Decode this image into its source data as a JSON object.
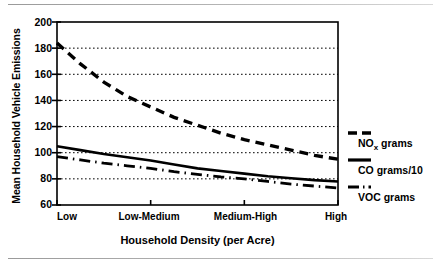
{
  "chart_data": {
    "type": "line",
    "title": "",
    "xlabel": "Household Density (per Acre)",
    "ylabel": "Mean Household Vehicle Emissions",
    "categories": [
      "Low",
      "Low-Medium",
      "Medium-High",
      "High"
    ],
    "x": [
      0,
      1,
      2,
      3
    ],
    "ylim": [
      60,
      200
    ],
    "yticks": [
      60,
      80,
      100,
      120,
      140,
      160,
      180,
      200
    ],
    "grid": "horizontal-dotted",
    "legend_position": "right-outside",
    "series": [
      {
        "name": "NOx grams",
        "style": "dashed",
        "values": [
          184,
          135,
          110,
          95
        ],
        "dense_x": [
          0,
          0.25,
          0.5,
          0.75,
          1,
          1.25,
          1.5,
          1.75,
          2,
          2.25,
          2.5,
          2.75,
          3
        ],
        "dense_y": [
          184,
          168,
          154,
          143,
          135,
          127,
          121,
          115,
          110,
          106,
          102,
          98,
          95
        ]
      },
      {
        "name": "CO grams/10",
        "style": "solid",
        "values": [
          105,
          94,
          84,
          78
        ],
        "dense_x": [
          0,
          0.25,
          0.5,
          0.75,
          1,
          1.25,
          1.5,
          1.75,
          2,
          2.25,
          2.5,
          2.75,
          3
        ],
        "dense_y": [
          105,
          102,
          99,
          96.5,
          94,
          91,
          88,
          86,
          84,
          82,
          80.5,
          79,
          78
        ]
      },
      {
        "name": "VOC grams",
        "style": "dash-dot",
        "values": [
          97,
          88,
          80,
          73
        ],
        "dense_x": [
          0,
          0.25,
          0.5,
          0.75,
          1,
          1.25,
          1.5,
          1.75,
          2,
          2.25,
          2.5,
          2.75,
          3
        ],
        "dense_y": [
          97,
          94.5,
          92,
          90,
          88,
          85.5,
          83.5,
          81.5,
          80,
          78,
          76,
          74.5,
          73
        ]
      }
    ]
  },
  "axes": {
    "y_title": "Mean Household Vehicle Emissions",
    "x_title": "Household Density (per Acre)",
    "y_ticks": [
      "200",
      "180",
      "160",
      "140",
      "120",
      "100",
      "80",
      "60"
    ],
    "x_ticks": [
      "Low",
      "Low-Medium",
      "Medium-High",
      "High"
    ]
  },
  "legend": {
    "items": [
      {
        "label": "NO",
        "sub": "x",
        "rest": " grams",
        "full": "NOx grams"
      },
      {
        "label": "CO grams/10",
        "full": "CO grams/10"
      },
      {
        "label": "VOC grams",
        "full": "VOC grams"
      }
    ],
    "nox_main": "NO",
    "nox_sub": "x",
    "nox_rest": " grams",
    "co_label": "CO grams/10",
    "voc_label": "VOC grams"
  },
  "colors": {
    "line": "#000000",
    "grid": "#000000",
    "background": "#ffffff",
    "rule": "#9a9a9a"
  }
}
